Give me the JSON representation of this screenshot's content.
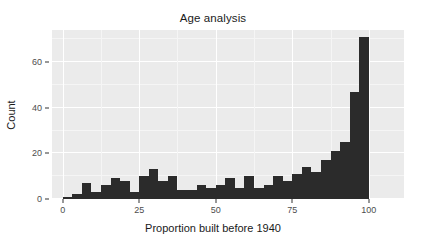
{
  "chart_data": {
    "type": "bar",
    "title": "Age analysis",
    "xlabel": "Proportion built before 1940",
    "ylabel": "Count",
    "xlim": [
      -3.5,
      111.5
    ],
    "ylim": [
      0,
      74
    ],
    "grid": true,
    "legend": null,
    "bin_width": 3.125,
    "xticks": [
      0,
      25,
      50,
      75,
      100
    ],
    "xtick_labels": [
      "0",
      "25",
      "50",
      "75",
      "100"
    ],
    "yticks": [
      0,
      20,
      40,
      60
    ],
    "ytick_labels": [
      "0",
      "20",
      "40",
      "60"
    ],
    "bar_color": "#2b2b2b",
    "panel_color": "#ebebeb",
    "grid_color": "#ffffff",
    "bin_starts": [
      0,
      3.125,
      6.25,
      9.375,
      12.5,
      15.625,
      18.75,
      21.875,
      25,
      28.125,
      31.25,
      34.375,
      37.5,
      40.625,
      43.75,
      46.875,
      50,
      53.125,
      56.25,
      59.375,
      62.5,
      65.625,
      68.75,
      71.875,
      75,
      78.125,
      81.25,
      84.375,
      87.5,
      90.625,
      93.75,
      96.875
    ],
    "categories": [
      "0",
      "3.1",
      "6.2",
      "9.4",
      "12.5",
      "15.6",
      "18.8",
      "21.9",
      "25",
      "28.1",
      "31.2",
      "34.4",
      "37.5",
      "40.6",
      "43.8",
      "46.9",
      "50",
      "53.1",
      "56.2",
      "59.4",
      "62.5",
      "65.6",
      "68.8",
      "71.9",
      "75",
      "78.1",
      "81.2",
      "84.4",
      "87.5",
      "90.6",
      "93.8",
      "96.9"
    ],
    "values": [
      1,
      2,
      7,
      3,
      6,
      9,
      8,
      3,
      10,
      13,
      8,
      10,
      4,
      4,
      6,
      5,
      6,
      9,
      5,
      10,
      5,
      6,
      10,
      8,
      11,
      14,
      12,
      17,
      21,
      25,
      47,
      71
    ]
  }
}
